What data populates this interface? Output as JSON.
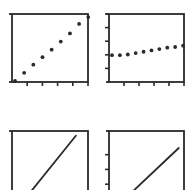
{
  "colors": {
    "ink": "#2a2a2a",
    "background": "#ffffff"
  },
  "chart_data": [
    {
      "type": "scatter",
      "panel": "top-left",
      "title": "",
      "xlabel": "",
      "ylabel": "",
      "grid": false,
      "x": [
        0,
        1,
        2,
        3,
        4,
        5,
        6,
        7,
        8
      ],
      "y": [
        0.0,
        0.12,
        0.24,
        0.35,
        0.46,
        0.58,
        0.7,
        0.84,
        0.94
      ],
      "x_ticks": 5,
      "y_ticks": 0,
      "xlim": [
        0,
        8.3
      ],
      "ylim": [
        0,
        1
      ]
    },
    {
      "type": "scatter",
      "panel": "top-right",
      "title": "",
      "xlabel": "",
      "ylabel": "",
      "grid": false,
      "x": [
        0,
        1,
        2,
        3,
        4,
        5,
        6,
        7,
        8,
        9
      ],
      "y": [
        0.38,
        0.38,
        0.39,
        0.41,
        0.43,
        0.45,
        0.47,
        0.49,
        0.5,
        0.52
      ],
      "x_ticks": 5,
      "y_ticks": 5,
      "xlim": [
        0,
        9.5
      ],
      "ylim": [
        0,
        1
      ]
    },
    {
      "type": "line",
      "panel": "bottom-left",
      "title": "",
      "xlabel": "",
      "ylabel": "",
      "grid": false,
      "x": [
        0.17,
        0.84
      ],
      "y": [
        0.0,
        0.93
      ],
      "x_ticks": 0,
      "y_ticks": 0,
      "xlim": [
        0,
        1
      ],
      "ylim": [
        0,
        1
      ]
    },
    {
      "type": "line",
      "panel": "bottom-right",
      "title": "",
      "xlabel": "",
      "ylabel": "",
      "grid": false,
      "x": [
        0.21,
        0.93
      ],
      "y": [
        0.0,
        0.75
      ],
      "x_ticks": 0,
      "y_ticks": 3,
      "xlim": [
        0,
        1
      ],
      "ylim": [
        0,
        1
      ]
    }
  ]
}
